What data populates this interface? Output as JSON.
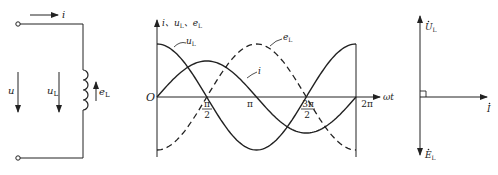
{
  "circuit": {
    "current_label": "i",
    "source_voltage_label": "u",
    "inductor_voltage_label": "u",
    "inductor_voltage_sub": "L",
    "emf_label": "e",
    "emf_sub": "L"
  },
  "waveform": {
    "y_axis_label": "i、u",
    "y_axis_label_sub1": "L",
    "y_axis_label_mid": "、e",
    "y_axis_label_sub2": "L",
    "x_axis_label": "ωt",
    "origin_label": "O",
    "ticks": {
      "pi_half_num": "π",
      "pi_half_den": "2",
      "pi": "π",
      "three_pi_half_num": "3π",
      "three_pi_half_den": "2",
      "two_pi": "2π"
    },
    "curve_labels": {
      "uL": "u",
      "uL_sub": "L",
      "i": "i",
      "eL": "e",
      "eL_sub": "L"
    }
  },
  "phasor": {
    "UL_label": "U",
    "UL_sub": "L",
    "I_label": "I",
    "EL_label": "E",
    "EL_sub": "L"
  },
  "chart_data": {
    "type": "line",
    "title": "",
    "xlabel": "ωt",
    "ylabel": "i、uL、eL",
    "x_ticks": [
      "O",
      "π/2",
      "π",
      "3π/2",
      "2π"
    ],
    "series": [
      {
        "name": "uL",
        "style": "solid",
        "function": "Um·cos(ωt)",
        "amplitude_relative": 1.0
      },
      {
        "name": "i",
        "style": "solid",
        "function": "Im·sin(ωt)",
        "amplitude_relative": 0.68
      },
      {
        "name": "eL",
        "style": "dashed",
        "function": "-Um·cos(ωt)",
        "amplitude_relative": 1.0
      }
    ],
    "xlim": [
      0,
      6.2832
    ]
  }
}
